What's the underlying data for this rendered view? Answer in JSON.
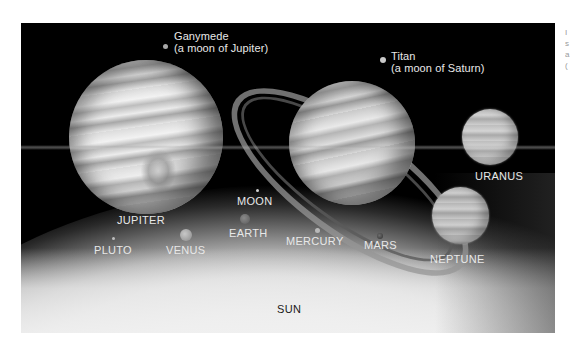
{
  "figure": {
    "labels": {
      "ganymede": {
        "line1": "Ganymede",
        "line2": "(a moon of Jupiter)"
      },
      "titan": {
        "line1": "Titan",
        "line2": "(a moon of Saturn)"
      },
      "jupiter": "JUPITER",
      "uranus": "URANUS",
      "neptune": "NEPTUNE",
      "moon": "MOON",
      "earth": "EARTH",
      "venus": "VENUS",
      "pluto": "PLUTO",
      "mercury": "MERCURY",
      "mars": "MARS",
      "sun": "SUN"
    },
    "colors": {
      "space_background": "#000000",
      "label_light": "#e8e8e8",
      "label_dark": "#1a1a1a",
      "page_background": "#ffffff"
    }
  },
  "side_caption_fragment": [
    "I",
    "s",
    "a",
    "("
  ]
}
